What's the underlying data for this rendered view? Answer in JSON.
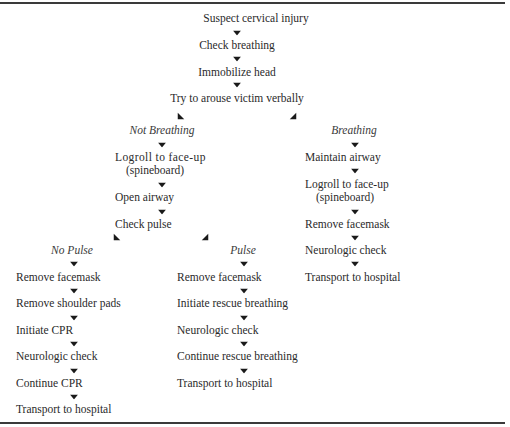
{
  "flowchart": {
    "root": [
      "Suspect cervical injury",
      "Check breathing",
      "Immobilize head",
      "Try to arouse victim verbally"
    ],
    "branches": {
      "not_breathing": {
        "label": "Not Breathing",
        "steps": [
          "Logroll to face-up",
          "(spineboard)",
          "Open airway",
          "Check pulse"
        ],
        "sub_branches": {
          "no_pulse": {
            "label": "No Pulse",
            "steps": [
              "Remove facemask",
              "Remove shoulder pads",
              "Initiate CPR",
              "Neurologic check",
              "Continue CPR",
              "Transport to hospital"
            ]
          },
          "pulse": {
            "label": "Pulse",
            "steps": [
              "Remove facemask",
              "Initiate rescue breathing",
              "Neurologic check",
              "Continue rescue breathing",
              "Transport to hospital"
            ]
          }
        }
      },
      "breathing": {
        "label": "Breathing",
        "steps": [
          "Maintain airway",
          "Logroll to face-up",
          "(spineboard)",
          "Remove facemask",
          "Neurologic check",
          "Transport to hospital"
        ]
      }
    }
  },
  "icons": {
    "down_arrow": "arrow-down",
    "diagonal_left_arrow": "arrow-down-left",
    "diagonal_right_arrow": "arrow-down-right"
  },
  "colors": {
    "text": "#2a2a2a",
    "rule": "#3a3a3a",
    "arrow": "#1a1a1a"
  }
}
